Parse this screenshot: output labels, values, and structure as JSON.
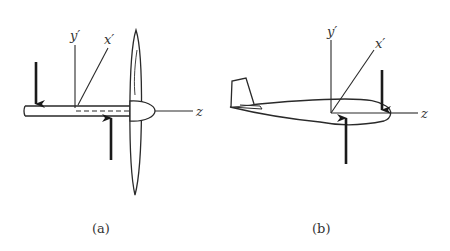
{
  "figure": {
    "panels": [
      {
        "id": "a",
        "caption": "(a)",
        "subject": "propeller-on-shaft",
        "axes": {
          "y": "y′",
          "x": "x′",
          "z": "z"
        },
        "forces": [
          "downward-force-arrow",
          "upward-force-arrow"
        ]
      },
      {
        "id": "b",
        "caption": "(b)",
        "subject": "airplane-fuselage",
        "axes": {
          "y": "y′",
          "x": "x′",
          "z": "z"
        },
        "forces": [
          "downward-force-arrow",
          "upward-force-arrow"
        ]
      }
    ]
  },
  "colors": {
    "line": "#2a2a2a",
    "text": "#333333",
    "background": "#ffffff"
  }
}
